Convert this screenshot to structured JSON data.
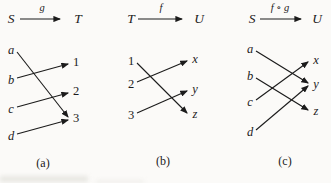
{
  "figure": {
    "ink_color": "#1b1b1b",
    "background_color": "#fbfaf8"
  },
  "diagrams": [
    {
      "caption": "(a)",
      "header": {
        "from": "S",
        "fn": "g",
        "to": "T"
      },
      "left": [
        "a",
        "b",
        "c",
        "d"
      ],
      "right": [
        "1",
        "2",
        "3"
      ],
      "maps": [
        {
          "from": "a",
          "to": "3"
        },
        {
          "from": "b",
          "to": "1"
        },
        {
          "from": "c",
          "to": "2"
        },
        {
          "from": "d",
          "to": "3"
        }
      ]
    },
    {
      "caption": "(b)",
      "header": {
        "from": "T",
        "fn": "f",
        "to": "U"
      },
      "left": [
        "1",
        "2",
        "3"
      ],
      "right": [
        "x",
        "y",
        "z"
      ],
      "maps": [
        {
          "from": "1",
          "to": "z"
        },
        {
          "from": "2",
          "to": "x"
        },
        {
          "from": "3",
          "to": "y"
        }
      ]
    },
    {
      "caption": "(c)",
      "header": {
        "from": "S",
        "fn": "f ∘ g",
        "to": "U"
      },
      "left": [
        "a",
        "b",
        "c",
        "d"
      ],
      "right": [
        "x",
        "y",
        "z"
      ],
      "maps": [
        {
          "from": "a",
          "to": "y"
        },
        {
          "from": "b",
          "to": "z"
        },
        {
          "from": "c",
          "to": "x"
        },
        {
          "from": "d",
          "to": "y"
        }
      ]
    }
  ]
}
